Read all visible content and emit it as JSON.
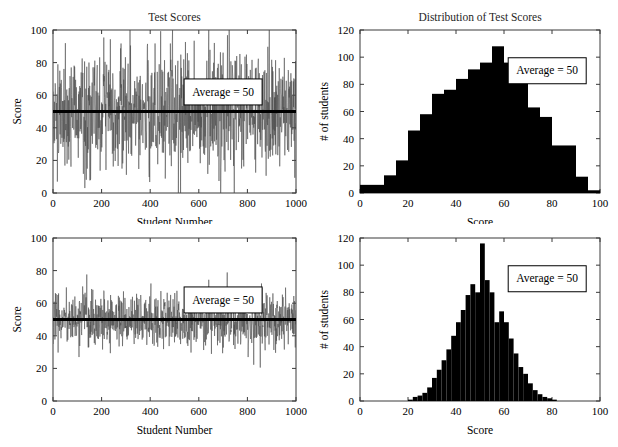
{
  "figure": {
    "name": "test-scores-figure",
    "width": 618,
    "height": 447,
    "background": "#ffffff",
    "series_color": "#4a4a4a",
    "mean_color": "#000000",
    "bar_color": "#000000",
    "axis_color": "#3a3a3a"
  },
  "charts": [
    {
      "id": "top-left",
      "type": "line",
      "title": "Test Scores",
      "xlabel": "Student Number",
      "ylabel": "Score",
      "xlim": [
        0,
        1000
      ],
      "ylim": [
        0,
        100
      ],
      "xticks": [
        0,
        200,
        400,
        600,
        800,
        1000
      ],
      "yticks": [
        0,
        20,
        40,
        60,
        80,
        100
      ],
      "xtick_labels": [
        "0",
        "200",
        "400",
        "600",
        "800",
        "1000"
      ],
      "ytick_labels": [
        "0",
        "20",
        "40",
        "60",
        "80",
        "100"
      ],
      "grid": false,
      "annotation": {
        "text": "Average = 50",
        "x_data": 700,
        "y_data": 62
      },
      "mean_line": {
        "value": 50,
        "label": "Average = 50"
      },
      "noise": {
        "n": 1000,
        "mean": 50,
        "sigma": 18,
        "seed": 1337,
        "clip": [
          0,
          100
        ]
      }
    },
    {
      "id": "top-right",
      "type": "bar",
      "title": "Distribution of Test Scores",
      "xlabel": "Score",
      "ylabel": "# of students",
      "xlim": [
        0,
        100
      ],
      "ylim": [
        0,
        120
      ],
      "xticks": [
        0,
        20,
        40,
        60,
        80,
        100
      ],
      "yticks": [
        0,
        20,
        40,
        60,
        80,
        100,
        120
      ],
      "xtick_labels": [
        "0",
        "20",
        "40",
        "60",
        "80",
        "100"
      ],
      "ytick_labels": [
        "0",
        "20",
        "40",
        "60",
        "80",
        "100",
        "120"
      ],
      "grid": false,
      "bin_width": 5,
      "bin_starts": [
        0,
        5,
        10,
        15,
        20,
        25,
        30,
        35,
        40,
        45,
        50,
        55,
        60,
        65,
        70,
        75,
        80,
        85,
        90,
        95
      ],
      "values": [
        6,
        6,
        13,
        24,
        46,
        58,
        73,
        76,
        84,
        91,
        96,
        108,
        96,
        93,
        63,
        56,
        35,
        35,
        12,
        2
      ],
      "annotation": {
        "text": "Average = 50",
        "x_data": 78,
        "y_data": 90
      }
    },
    {
      "id": "bottom-left",
      "type": "line",
      "title": "",
      "xlabel": "Student Number",
      "ylabel": "Score",
      "xlim": [
        0,
        1000
      ],
      "ylim": [
        0,
        100
      ],
      "xticks": [
        0,
        200,
        400,
        600,
        800,
        1000
      ],
      "yticks": [
        0,
        20,
        40,
        60,
        80,
        100
      ],
      "xtick_labels": [
        "0",
        "200",
        "400",
        "600",
        "800",
        "1000"
      ],
      "ytick_labels": [
        "0",
        "20",
        "40",
        "60",
        "80",
        "100"
      ],
      "grid": false,
      "annotation": {
        "text": "Average = 50",
        "x_data": 700,
        "y_data": 62
      },
      "mean_line": {
        "value": 50,
        "label": "Average = 50"
      },
      "noise": {
        "n": 1000,
        "mean": 50,
        "sigma": 8.5,
        "seed": 24601,
        "clip": [
          0,
          100
        ]
      }
    },
    {
      "id": "bottom-right",
      "type": "bar",
      "title": "",
      "xlabel": "Score",
      "ylabel": "# of students",
      "xlim": [
        0,
        100
      ],
      "ylim": [
        0,
        120
      ],
      "xticks": [
        0,
        20,
        40,
        60,
        80,
        100
      ],
      "yticks": [
        0,
        20,
        40,
        60,
        80,
        100,
        120
      ],
      "xtick_labels": [
        "0",
        "20",
        "40",
        "60",
        "80",
        "100"
      ],
      "ytick_labels": [
        "0",
        "20",
        "40",
        "60",
        "80",
        "100",
        "120"
      ],
      "grid": false,
      "bin_width": 2,
      "bin_starts": [
        20,
        22,
        24,
        26,
        28,
        30,
        32,
        34,
        36,
        38,
        40,
        42,
        44,
        46,
        48,
        50,
        52,
        54,
        56,
        58,
        60,
        62,
        64,
        66,
        68,
        70,
        72,
        74,
        76,
        78,
        80
      ],
      "values": [
        1,
        3,
        4,
        6,
        10,
        17,
        23,
        30,
        38,
        48,
        58,
        67,
        78,
        86,
        80,
        116,
        89,
        80,
        58,
        66,
        58,
        46,
        35,
        25,
        20,
        13,
        8,
        5,
        3,
        2,
        1
      ],
      "annotation": {
        "text": "Average = 50",
        "x_data": 78,
        "y_data": 90
      }
    }
  ],
  "chart_data": [
    {
      "type": "line",
      "title": "Test Scores",
      "xlabel": "Student Number",
      "ylabel": "Score",
      "xlim": [
        0,
        1000
      ],
      "ylim": [
        0,
        100
      ],
      "xticks": [
        0,
        200,
        400,
        600,
        800,
        1000
      ],
      "yticks": [
        0,
        20,
        40,
        60,
        80,
        100
      ],
      "grid": false,
      "legend_position": "none",
      "annotations": [
        "Average = 50"
      ],
      "series": [
        {
          "name": "Score per student (high spread)",
          "description": "1000 noisy scores, mean 50, standard deviation about 18, spanning roughly 0 to 100",
          "n": 1000,
          "mean": 50,
          "std": 18,
          "min": 0,
          "max": 100
        },
        {
          "name": "Average",
          "description": "Horizontal reference line at Score = 50",
          "value": 50
        }
      ]
    },
    {
      "type": "bar",
      "title": "Distribution of Test Scores",
      "xlabel": "Score",
      "ylabel": "# of students",
      "xlim": [
        0,
        100
      ],
      "ylim": [
        0,
        120
      ],
      "xticks": [
        0,
        20,
        40,
        60,
        80,
        100
      ],
      "yticks": [
        0,
        20,
        40,
        60,
        80,
        100,
        120
      ],
      "grid": false,
      "legend_position": "none",
      "annotations": [
        "Average = 50"
      ],
      "bin_width": 5,
      "categories": [
        "0-5",
        "5-10",
        "10-15",
        "15-20",
        "20-25",
        "25-30",
        "30-35",
        "35-40",
        "40-45",
        "45-50",
        "50-55",
        "55-60",
        "60-65",
        "65-70",
        "70-75",
        "75-80",
        "80-85",
        "85-90",
        "90-95",
        "95-100"
      ],
      "values": [
        6,
        6,
        13,
        24,
        46,
        58,
        73,
        76,
        84,
        91,
        96,
        108,
        96,
        93,
        63,
        56,
        35,
        35,
        12,
        2
      ]
    },
    {
      "type": "line",
      "title": "",
      "xlabel": "Student Number",
      "ylabel": "Score",
      "xlim": [
        0,
        1000
      ],
      "ylim": [
        0,
        100
      ],
      "xticks": [
        0,
        200,
        400,
        600,
        800,
        1000
      ],
      "yticks": [
        0,
        20,
        40,
        60,
        80,
        100
      ],
      "grid": false,
      "legend_position": "none",
      "annotations": [
        "Average = 50"
      ],
      "series": [
        {
          "name": "Score per student (low spread)",
          "description": "1000 noisy scores, mean 50, standard deviation about 8.5, spanning roughly 20 to 82",
          "n": 1000,
          "mean": 50,
          "std": 8.5,
          "min": 20,
          "max": 82
        },
        {
          "name": "Average",
          "description": "Horizontal reference line at Score = 50",
          "value": 50
        }
      ]
    },
    {
      "type": "bar",
      "title": "",
      "xlabel": "Score",
      "ylabel": "# of students",
      "xlim": [
        0,
        100
      ],
      "ylim": [
        0,
        120
      ],
      "xticks": [
        0,
        20,
        40,
        60,
        80,
        100
      ],
      "yticks": [
        0,
        20,
        40,
        60,
        80,
        100,
        120
      ],
      "grid": false,
      "legend_position": "none",
      "annotations": [
        "Average = 50"
      ],
      "bin_width": 2,
      "categories": [
        "20-22",
        "22-24",
        "24-26",
        "26-28",
        "28-30",
        "30-32",
        "32-34",
        "34-36",
        "36-38",
        "38-40",
        "40-42",
        "42-44",
        "44-46",
        "46-48",
        "48-50",
        "50-52",
        "52-54",
        "54-56",
        "56-58",
        "58-60",
        "60-62",
        "62-64",
        "64-66",
        "66-68",
        "68-70",
        "70-72",
        "72-74",
        "74-76",
        "76-78",
        "78-80",
        "80-82"
      ],
      "values": [
        1,
        3,
        4,
        6,
        10,
        17,
        23,
        30,
        38,
        48,
        58,
        67,
        78,
        86,
        80,
        116,
        89,
        80,
        58,
        66,
        58,
        46,
        35,
        25,
        20,
        13,
        8,
        5,
        3,
        2,
        1
      ]
    }
  ]
}
